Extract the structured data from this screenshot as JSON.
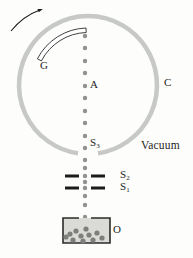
{
  "figure": {
    "labels": {
      "drum": "G",
      "axis": "A",
      "chamber": "C",
      "vacuum": "Vacuum",
      "slit3_base": "S",
      "slit3_sub": "3",
      "slit2_base": "S",
      "slit2_sub": "2",
      "slit1_base": "S",
      "slit1_sub": "1",
      "oven": "O"
    },
    "colors": {
      "background": "#fdfdfb",
      "chamber_wall": "#c7c9c6",
      "beam_dot": "#8f928f",
      "slit_bar": "#1b1b1b",
      "drum_outline": "#2b2b2b",
      "drum_fill": "#ffffff",
      "arrow": "#1b1b1b",
      "oven_fill": "#dadad6",
      "oven_border": "#2b2b2b",
      "oven_dot": "#7c7f7c",
      "text": "#1f1f1f"
    },
    "beam": {
      "x": 85,
      "dot_radius": 2.2,
      "dot_ys": [
        36,
        48,
        61,
        73,
        86,
        98,
        111,
        123,
        136,
        148,
        160,
        168,
        176,
        182,
        188,
        196,
        205,
        217
      ]
    },
    "oven_particles": [
      [
        70,
        234
      ],
      [
        76,
        231
      ],
      [
        81,
        236
      ],
      [
        86,
        229
      ],
      [
        89,
        235
      ],
      [
        93,
        240
      ],
      [
        97,
        233
      ],
      [
        102,
        238
      ],
      [
        73,
        240
      ],
      [
        83,
        241
      ],
      [
        66,
        237
      ]
    ]
  }
}
